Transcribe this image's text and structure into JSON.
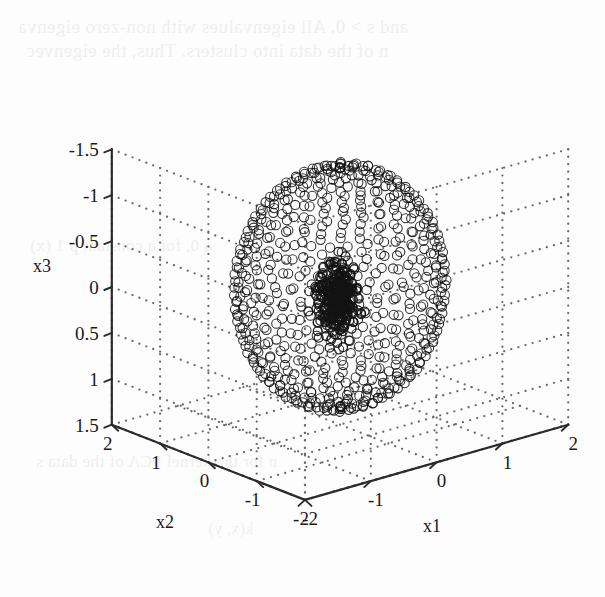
{
  "page": {
    "width": 605,
    "height": 597,
    "background_color": "#fdfdfd",
    "figure_kind": "matlab-3d-scatter"
  },
  "ghost_text": {
    "note": "faint show-through text from the opposite side of the scanned book page",
    "lines": [
      "and s > 0. All eigenvalues with non-zero eigenva",
      "n of the data into clusters. Thus, the eigenvec",
      "a 0, for a constant p 1 (x)",
      "n for the kernel PCA of the data s",
      "k(x, y)"
    ]
  },
  "chart_data": {
    "type": "scatter",
    "title": "",
    "projection": "3d",
    "xlabel": "x1",
    "ylabel": "x2",
    "zlabel": "x3",
    "xlim": [
      -2,
      2
    ],
    "ylim": [
      -2,
      2
    ],
    "zlim": [
      -1.5,
      1.5
    ],
    "xticks": [
      -2,
      -1,
      0,
      1,
      2
    ],
    "xtick_labels": [
      "-2",
      "-1",
      "0",
      "1",
      "2"
    ],
    "yticks": [
      -2,
      -1,
      0,
      1,
      2
    ],
    "ytick_labels": [
      "-2",
      "-1",
      "0",
      "1",
      "2"
    ],
    "zticks": [
      -1.5,
      -1,
      -0.5,
      0,
      0.5,
      1,
      1.5
    ],
    "ztick_labels": [
      "1.5",
      "1",
      "0.5",
      "0",
      "-0.5",
      "-1",
      "-1.5"
    ],
    "grid": true,
    "grid_style": "dotted",
    "grid_color": "#6a6a6a",
    "axis_color": "#2b2b2b",
    "legend": null,
    "marker": "open-circle",
    "marker_edge_color": "#111111",
    "series": [
      {
        "name": "outer spherical shell",
        "description": "points sampled on a sphere of radius ~1.3 centred at the origin, drawn as open circles; latitude rings crowd at the poles producing dark bands",
        "n_points": 620,
        "marker": "o",
        "marker_size": 9,
        "filled": false,
        "shape": "sphere-shell",
        "radius": 1.3,
        "center": [
          0,
          0,
          0
        ]
      },
      {
        "name": "inner dense cluster",
        "description": "compact blob of heavily overlapping open circles near the origin, rendering almost solid dark grey",
        "n_points": 320,
        "marker": "o",
        "marker_size": 9,
        "filled": false,
        "shape": "gaussian-blob",
        "radius": 0.42,
        "center": [
          -0.05,
          0.0,
          -0.12
        ]
      }
    ]
  },
  "axis_labels": {
    "x1": "x1",
    "x2": "x2",
    "x3": "x3"
  }
}
